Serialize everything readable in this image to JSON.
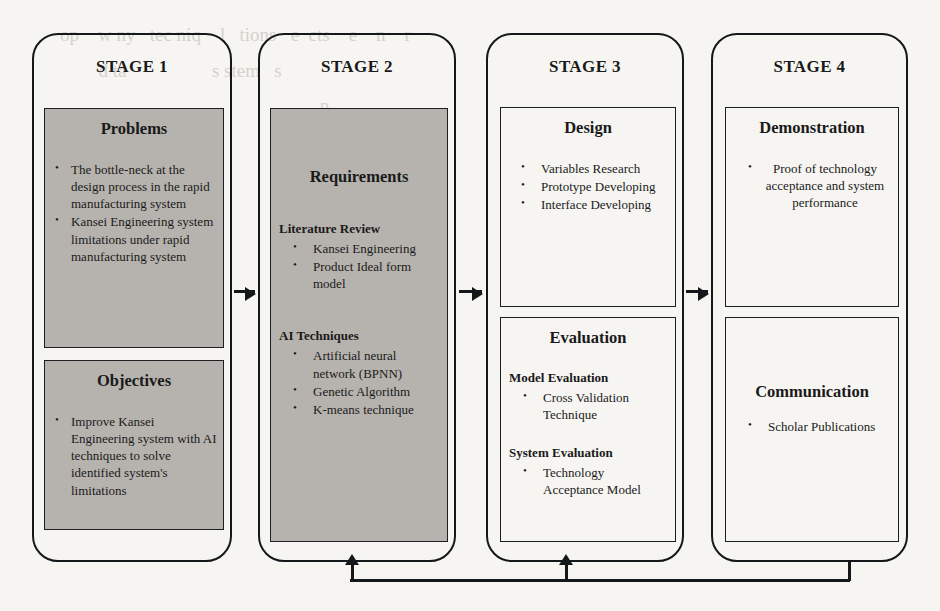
{
  "diagram": {
    "shade_color": "#b6b3ae",
    "line_color": "#15181a"
  },
  "stages": [
    {
      "id": "stage-1",
      "title": "STAGE 1",
      "boxes": [
        {
          "id": "problems",
          "title": "Problems",
          "shaded": true,
          "bullets": [
            "The bottle-neck at the design process in the rapid manufacturing system",
            "Kansei Engineering system limitations under rapid manufacturing system"
          ]
        },
        {
          "id": "objectives",
          "title": "Objectives",
          "shaded": true,
          "bullets": [
            "Improve Kansei Engineering system with AI techniques to solve identified system's limitations"
          ]
        }
      ]
    },
    {
      "id": "stage-2",
      "title": "STAGE 2",
      "boxes": [
        {
          "id": "requirements",
          "title": "Requirements",
          "shaded": true,
          "groups": [
            {
              "heading": "Literature Review",
              "bullets": [
                "Kansei Engineering",
                "Product Ideal form model"
              ]
            },
            {
              "heading": "AI Techniques",
              "bullets": [
                "Artificial neural network (BPNN)",
                "Genetic Algorithm",
                "K-means technique"
              ]
            }
          ]
        }
      ]
    },
    {
      "id": "stage-3",
      "title": "STAGE 3",
      "boxes": [
        {
          "id": "design",
          "title": "Design",
          "shaded": false,
          "bullets": [
            "Variables Research",
            "Prototype Developing",
            "Interface Developing"
          ]
        },
        {
          "id": "evaluation",
          "title": "Evaluation",
          "shaded": false,
          "groups": [
            {
              "heading": "Model Evaluation",
              "bullets": [
                "Cross Validation Technique"
              ]
            },
            {
              "heading": "System Evaluation",
              "bullets": [
                "Technology Acceptance Model"
              ]
            }
          ]
        }
      ]
    },
    {
      "id": "stage-4",
      "title": "STAGE 4",
      "boxes": [
        {
          "id": "demonstration",
          "title": "Demonstration",
          "shaded": false,
          "bullets": [
            "Proof of technology acceptance and system performance"
          ]
        },
        {
          "id": "communication",
          "title": "Communication",
          "shaded": false,
          "bullets": [
            "Scholar Publications"
          ]
        }
      ]
    }
  ],
  "connectors": {
    "flow_1_2": "arrow-stage1-to-stage2",
    "flow_2_3": "arrow-stage2-to-stage3",
    "flow_3_4": "arrow-stage3-to-stage4",
    "feedback_to_stage3": "feedback-arrow-into-stage3",
    "feedback_to_stage2": "feedback-arrow-into-stage2"
  },
  "background_bleed": {
    "lines": [
      "top secondary text",
      "methodology research development",
      "manufacturing design system process",
      "Kansei Engineering artificial",
      "rapid prototype evaluation"
    ]
  }
}
